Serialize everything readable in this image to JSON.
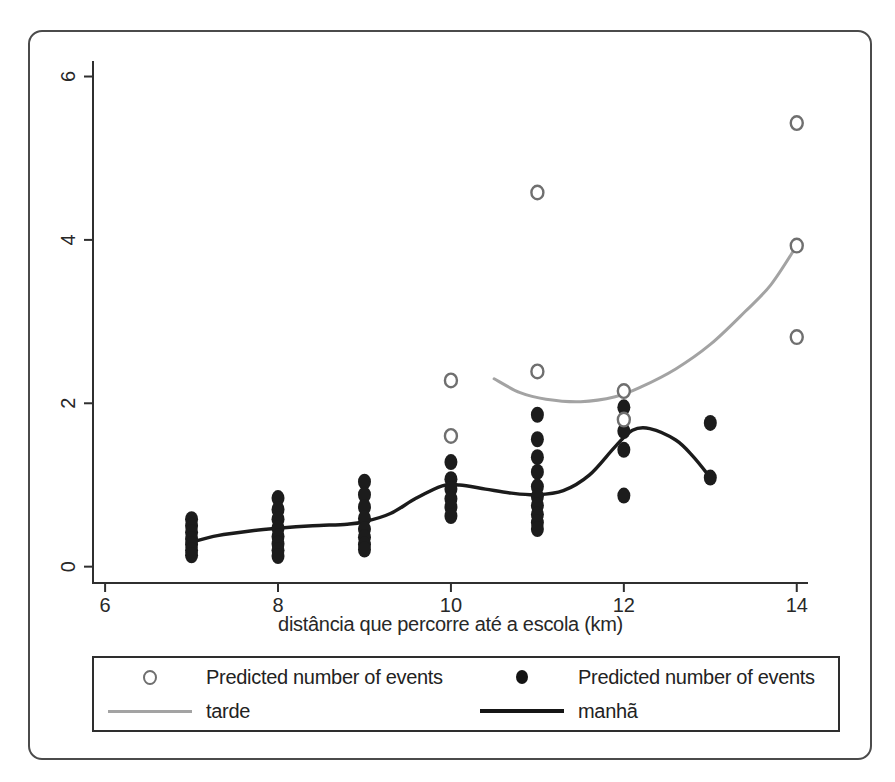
{
  "figure": {
    "background": "#ffffff",
    "frame_border_color": "#4b4b4b"
  },
  "chart_data": {
    "type": "scatter",
    "title": "",
    "xlabel": "distância que percorre até a escola (km)",
    "ylabel": "",
    "x_ticks": [
      6,
      8,
      10,
      12,
      14
    ],
    "y_ticks": [
      0,
      2,
      4,
      6
    ],
    "xlim": [
      5.86,
      14.13
    ],
    "ylim": [
      -0.2,
      6.19
    ],
    "grid": false,
    "legend_position": "bottom",
    "axis_color": "#2f2f2f",
    "tick_label_color": "#282828",
    "series": [
      {
        "name": "tarde",
        "kind": "line",
        "color": "#a3a3a3",
        "width": 3,
        "points": [
          [
            10.5,
            2.3
          ],
          [
            10.8,
            2.13
          ],
          [
            11.1,
            2.05
          ],
          [
            11.5,
            2.02
          ],
          [
            11.9,
            2.08
          ],
          [
            12.2,
            2.2
          ],
          [
            12.6,
            2.42
          ],
          [
            13.0,
            2.72
          ],
          [
            13.4,
            3.12
          ],
          [
            13.7,
            3.45
          ],
          [
            14,
            3.93
          ]
        ]
      },
      {
        "name": "manhã",
        "kind": "line",
        "color": "#1b1b1b",
        "width": 3.4,
        "points": [
          [
            7,
            0.3
          ],
          [
            7.3,
            0.38
          ],
          [
            7.7,
            0.44
          ],
          [
            8,
            0.47
          ],
          [
            8.4,
            0.5
          ],
          [
            8.8,
            0.52
          ],
          [
            9,
            0.55
          ],
          [
            9.3,
            0.65
          ],
          [
            9.6,
            0.84
          ],
          [
            9.9,
            0.99
          ],
          [
            10.1,
            1.0
          ],
          [
            10.4,
            0.95
          ],
          [
            10.7,
            0.9
          ],
          [
            11,
            0.88
          ],
          [
            11.3,
            0.93
          ],
          [
            11.6,
            1.12
          ],
          [
            11.9,
            1.47
          ],
          [
            12.1,
            1.67
          ],
          [
            12.3,
            1.69
          ],
          [
            12.6,
            1.55
          ],
          [
            12.8,
            1.35
          ],
          [
            13,
            1.09
          ]
        ]
      },
      {
        "name": "Predicted number of events",
        "group": "manhã",
        "kind": "scatter",
        "marker": "filled-circle",
        "color": "#1c1c1c",
        "points": [
          [
            7,
            0.58
          ],
          [
            7,
            0.5
          ],
          [
            7,
            0.42
          ],
          [
            7,
            0.34
          ],
          [
            7,
            0.27
          ],
          [
            7,
            0.2
          ],
          [
            7,
            0.14
          ],
          [
            8,
            0.84
          ],
          [
            8,
            0.7
          ],
          [
            8,
            0.58
          ],
          [
            8,
            0.47
          ],
          [
            8,
            0.37
          ],
          [
            8,
            0.28
          ],
          [
            8,
            0.2
          ],
          [
            8,
            0.13
          ],
          [
            9,
            1.04
          ],
          [
            9,
            0.88
          ],
          [
            9,
            0.73
          ],
          [
            9,
            0.59
          ],
          [
            9,
            0.46
          ],
          [
            9,
            0.36
          ],
          [
            9,
            0.27
          ],
          [
            9,
            0.21
          ],
          [
            10,
            1.28
          ],
          [
            10,
            1.07
          ],
          [
            10,
            0.95
          ],
          [
            10,
            0.83
          ],
          [
            10,
            0.73
          ],
          [
            10,
            0.62
          ],
          [
            11,
            1.86
          ],
          [
            11,
            1.56
          ],
          [
            11,
            1.34
          ],
          [
            11,
            1.16
          ],
          [
            11,
            0.98
          ],
          [
            11,
            0.86
          ],
          [
            11,
            0.75
          ],
          [
            11,
            0.64
          ],
          [
            11,
            0.54
          ],
          [
            11,
            0.46
          ],
          [
            12,
            1.95
          ],
          [
            12,
            1.66
          ],
          [
            12,
            1.43
          ],
          [
            12,
            0.87
          ],
          [
            13,
            1.76
          ],
          [
            13,
            1.09
          ]
        ]
      },
      {
        "name": "Predicted number of events",
        "group": "tarde",
        "kind": "scatter",
        "marker": "open-circle",
        "color": "#6f6f6f",
        "points": [
          [
            10,
            2.28
          ],
          [
            10,
            1.6
          ],
          [
            11,
            4.58
          ],
          [
            11,
            2.39
          ],
          [
            12,
            2.15
          ],
          [
            12,
            1.8
          ],
          [
            14,
            5.43
          ],
          [
            14,
            3.93
          ],
          [
            14,
            2.81
          ]
        ]
      }
    ]
  },
  "legend": {
    "entries": [
      {
        "marker": "open-circle",
        "label": "Predicted number of events"
      },
      {
        "marker": "filled-circle",
        "label": "Predicted number of events"
      },
      {
        "marker": "gray-line",
        "label": "tarde"
      },
      {
        "marker": "black-line",
        "label": "manhã"
      }
    ]
  }
}
